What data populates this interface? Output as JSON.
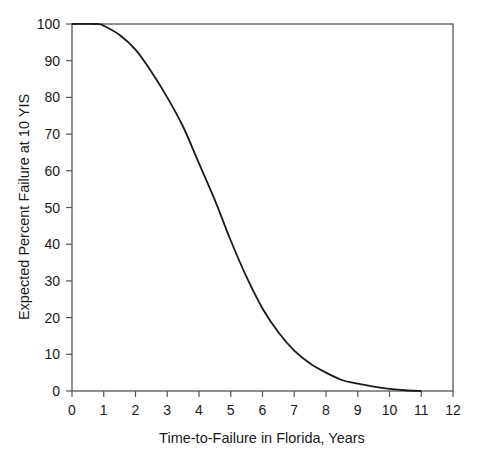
{
  "chart_data": {
    "type": "line",
    "title": "",
    "xlabel": "Time-to-Failure in Florida, Years",
    "ylabel": "Expected Percent Failure at 10 YIS",
    "xlim": [
      0,
      12
    ],
    "ylim": [
      0,
      100
    ],
    "x_ticks": [
      0,
      1,
      2,
      3,
      4,
      5,
      6,
      7,
      8,
      9,
      10,
      11,
      12
    ],
    "y_ticks": [
      0,
      10,
      20,
      30,
      40,
      50,
      60,
      70,
      80,
      90,
      100
    ],
    "grid": false,
    "legend": null,
    "series": [
      {
        "name": "Expected Percent Failure",
        "color": "#1a1a1a",
        "x": [
          0,
          0.8,
          1.0,
          1.5,
          2.0,
          2.5,
          3.0,
          3.5,
          4.0,
          4.5,
          5.0,
          5.5,
          6.0,
          6.5,
          7.0,
          7.5,
          8.0,
          8.5,
          9.0,
          9.5,
          10.0,
          10.5,
          11.0
        ],
        "values": [
          100,
          100,
          99.5,
          97,
          93,
          87,
          80,
          72,
          62,
          52,
          41,
          31,
          22.5,
          16,
          11,
          7.5,
          5,
          3,
          2,
          1.2,
          0.6,
          0.2,
          0
        ]
      }
    ]
  },
  "colors": {
    "axis": "#555555",
    "line": "#1a1a1a",
    "background": "#ffffff"
  }
}
